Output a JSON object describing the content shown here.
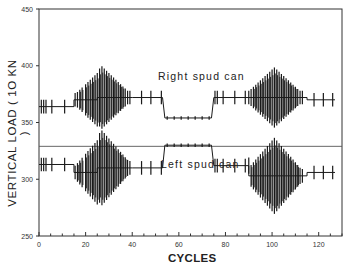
{
  "chart_data": {
    "type": "line",
    "title": "",
    "xlabel": "CYCLES",
    "ylabel": "VERTICAL LOAD ( 10 KN )",
    "xlim": [
      0,
      130
    ],
    "ylim": [
      250,
      450
    ],
    "xticks": [
      0,
      20,
      40,
      60,
      80,
      100,
      120
    ],
    "yticks": [
      250,
      300,
      350,
      400,
      450
    ],
    "grid": false,
    "legend": null,
    "reference_line": {
      "y": 329,
      "description": "horizontal reference line separating the two curves"
    },
    "annotations": [
      {
        "text": "Right spud can",
        "x": 55,
        "y": 375
      },
      {
        "text": "Left spud can",
        "x": 57,
        "y": 296
      }
    ],
    "series": [
      {
        "name": "Right spud can",
        "baseline_segments": [
          {
            "x": [
              0,
              15
            ],
            "y": 364
          },
          {
            "x": [
              15,
              25
            ],
            "y": 370
          },
          {
            "x": [
              25,
              40
            ],
            "y": 372
          },
          {
            "x": [
              40,
              53
            ],
            "y": 372
          },
          {
            "x": [
              54,
              74
            ],
            "y": 354
          },
          {
            "x": [
              75,
              90
            ],
            "y": 372
          },
          {
            "x": [
              90,
              115
            ],
            "y": 372
          },
          {
            "x": [
              115,
              127
            ],
            "y": 370
          }
        ],
        "oscillation_peaks": [
          {
            "x": 27,
            "max": 407,
            "min": 352
          },
          {
            "x": 101,
            "max": 405,
            "min": 352
          }
        ],
        "values_summary": {
          "mean_before": 364,
          "mean_hold": 354,
          "mean_after": 371,
          "max": 407,
          "min": 352
        }
      },
      {
        "name": "Left spud can",
        "baseline_segments": [
          {
            "x": [
              0,
              15
            ],
            "y": 313
          },
          {
            "x": [
              15,
              25
            ],
            "y": 306
          },
          {
            "x": [
              25,
              40
            ],
            "y": 310
          },
          {
            "x": [
              40,
              53
            ],
            "y": 310
          },
          {
            "x": [
              54,
              74
            ],
            "y": 330
          },
          {
            "x": [
              75,
              90
            ],
            "y": 312
          },
          {
            "x": [
              90,
              115
            ],
            "y": 303
          },
          {
            "x": [
              115,
              127
            ],
            "y": 306
          }
        ],
        "oscillation_peaks": [
          {
            "x": 27,
            "max": 332,
            "min": 266
          },
          {
            "x": 101,
            "max": 330,
            "min": 263
          }
        ],
        "values_summary": {
          "mean_before": 313,
          "mean_hold": 330,
          "mean_after": 307,
          "max": 332,
          "min": 263
        }
      }
    ]
  },
  "labels": {
    "ylabel": "VERTICAL LOAD ( 1O KN )",
    "xlabel": "CYCLES",
    "right": "Right spud can",
    "left": "Left spud can"
  },
  "colors": {
    "line": "#1a1a1a",
    "axis": "#333333",
    "background": "#ffffff"
  }
}
